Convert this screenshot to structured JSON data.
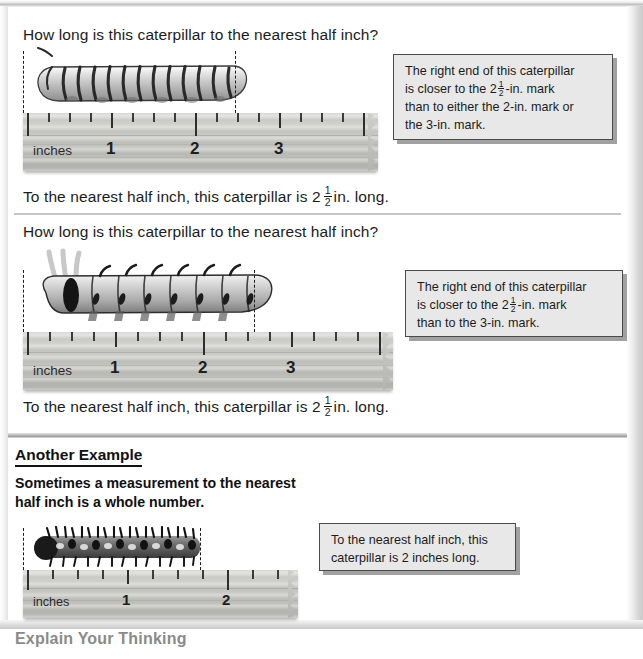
{
  "page": {
    "background": "#ffffff",
    "frame_color": "#c9c9c9"
  },
  "sections": [
    {
      "id": "example-1",
      "question": "How long is this caterpillar to the nearest half inch?",
      "answer_prefix": "To the nearest half inch, this caterpillar is 2",
      "answer_fraction_numerator": "1",
      "answer_fraction_denominator": "2",
      "answer_suffix": "in. long.",
      "callout_lines": [
        "The right end of this caterpillar",
        "is closer to the 2|1/2|-in. mark",
        "than to either the 2-in. mark or",
        "the 3-in. mark."
      ],
      "callout_line_2_prefix": "is closer to the 2",
      "callout_line_2_num": "1",
      "callout_line_2_den": "2",
      "callout_line_2_suffix": "-in. mark",
      "ruler": {
        "unit_label": "inches",
        "marks": [
          "1",
          "2",
          "3"
        ]
      },
      "caterpillar": "banded-caterpillar"
    },
    {
      "id": "example-2",
      "question": "How long is this caterpillar to the nearest half inch?",
      "answer_prefix": "To the nearest half inch, this caterpillar is 2",
      "answer_fraction_numerator": "1",
      "answer_fraction_denominator": "2",
      "answer_suffix": "in. long.",
      "callout_lines": [
        "The right end of this caterpillar",
        "is closer to the 2|1/2|-in. mark",
        "than to the 3-in. mark."
      ],
      "callout_line_2_prefix": "is closer to the 2",
      "callout_line_2_num": "1",
      "callout_line_2_den": "2",
      "callout_line_2_suffix": "-in. mark",
      "callout_line_3": "than to the 3-in. mark.",
      "ruler": {
        "unit_label": "inches",
        "marks": [
          "1",
          "2",
          "3"
        ]
      },
      "caterpillar": "tentacled-caterpillar"
    }
  ],
  "another_example": {
    "heading": "Another Example",
    "body_line_1": "Sometimes a measurement to the nearest",
    "body_line_2": "half inch is a whole number.",
    "callout_line_1": "To the nearest half inch, this",
    "callout_line_2": "caterpillar is 2 inches long.",
    "ruler": {
      "unit_label": "inches",
      "marks": [
        "1",
        "2"
      ]
    },
    "caterpillar": "bristly-caterpillar"
  },
  "explain": {
    "heading": "Explain Your Thinking"
  },
  "callout_line_1_text": "The right end of this caterpillar",
  "callout_line_4_text": "the 3-in. mark.",
  "callout_line_3_text": "than to either the 2-in. mark or"
}
